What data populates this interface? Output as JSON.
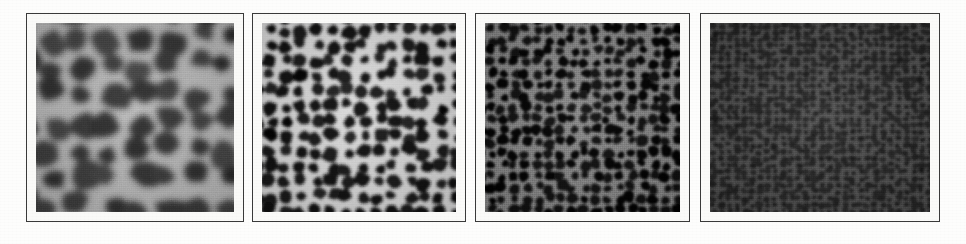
{
  "figure": {
    "background_color": "#fdfdfc",
    "frame_color": "#3a3a3a",
    "mat_color": "#fafaf8",
    "panel_count": 4,
    "caption": "",
    "panels": [
      {
        "id": "panel-1",
        "label": "",
        "description": "Coarse cellular foam micrograph with large dark polygonal cells and bright grey cell walls",
        "cell_scale": "coarse",
        "approx_cell_size_px": 40,
        "wall_color": "#b9b9b9",
        "cell_color": "#3a3a3a",
        "mean_brightness": 0.33,
        "contrast": "medium",
        "x": 26,
        "y": 13,
        "width": 218,
        "height": 209
      },
      {
        "id": "panel-2",
        "label": "",
        "description": "Medium cellular foam micrograph with smaller dark cells and bright white cell walls",
        "cell_scale": "medium",
        "approx_cell_size_px": 19,
        "wall_color": "#e8e8e8",
        "cell_color": "#131313",
        "mean_brightness": 0.3,
        "contrast": "high",
        "x": 252,
        "y": 13,
        "width": 214,
        "height": 209
      },
      {
        "id": "panel-3",
        "label": "",
        "description": "Fine cellular foam micrograph with small black cells and dim grey walls, overall dark",
        "cell_scale": "fine",
        "approx_cell_size_px": 14,
        "wall_color": "#6e6e6e",
        "cell_color": "#080808",
        "mean_brightness": 0.18,
        "contrast": "medium-low",
        "x": 475,
        "y": 13,
        "width": 215,
        "height": 209
      },
      {
        "id": "panel-4",
        "label": "",
        "description": "Very fine, low contrast mottled micrograph; cell structure barely resolved",
        "cell_scale": "very-fine",
        "approx_cell_size_px": 8,
        "wall_color": "#4a4a4a",
        "cell_color": "#262626",
        "mean_brightness": 0.22,
        "contrast": "low",
        "x": 700,
        "y": 13,
        "width": 240,
        "height": 209
      }
    ]
  }
}
